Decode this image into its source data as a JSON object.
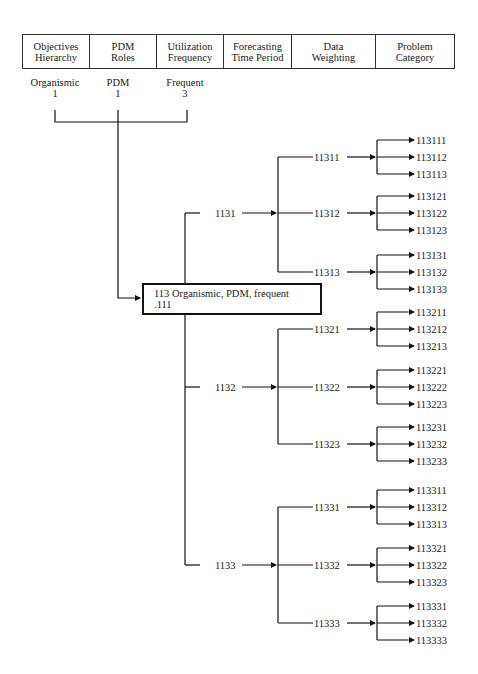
{
  "header": {
    "columns": [
      {
        "line1": "Objectives",
        "line2": "Hierarchy"
      },
      {
        "line1": "PDM",
        "line2": "Roles"
      },
      {
        "line1": "Utilization",
        "line2": "Frequency"
      },
      {
        "line1": "Forecasting",
        "line2": "Time Period"
      },
      {
        "line1": "Data",
        "line2": "Weighting"
      },
      {
        "line1": "Problem",
        "line2": "Category"
      }
    ]
  },
  "factors": [
    {
      "name": "Organismic",
      "code": "1"
    },
    {
      "name": "PDM",
      "code": "1"
    },
    {
      "name": "Frequent",
      "code": "3"
    }
  ],
  "root": {
    "line1": "113 Organismic, PDM, frequent",
    "line2": ".111"
  },
  "tree": [
    {
      "code": "1131",
      "children": [
        {
          "code": "11311",
          "leaves": [
            "113111",
            "113112",
            "113113"
          ]
        },
        {
          "code": "11312",
          "leaves": [
            "113121",
            "113122",
            "113123"
          ]
        },
        {
          "code": "11313",
          "leaves": [
            "113131",
            "113132",
            "113133"
          ]
        }
      ]
    },
    {
      "code": "1132",
      "children": [
        {
          "code": "11321",
          "leaves": [
            "113211",
            "113212",
            "113213"
          ]
        },
        {
          "code": "11322",
          "leaves": [
            "113221",
            "113222",
            "113223"
          ]
        },
        {
          "code": "11323",
          "leaves": [
            "113231",
            "113232",
            "113233"
          ]
        }
      ]
    },
    {
      "code": "1133",
      "children": [
        {
          "code": "11331",
          "leaves": [
            "113311",
            "113312",
            "113313"
          ]
        },
        {
          "code": "11332",
          "leaves": [
            "113321",
            "113322",
            "113323"
          ]
        },
        {
          "code": "11333",
          "leaves": [
            "113331",
            "113332",
            "113333"
          ]
        }
      ]
    }
  ]
}
